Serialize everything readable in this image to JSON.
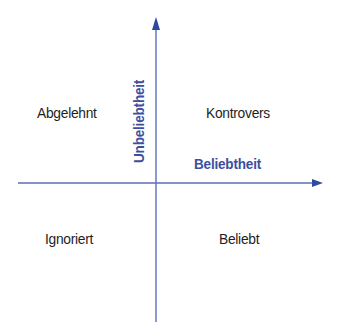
{
  "diagram": {
    "type": "quadrant",
    "colors": {
      "axis": "#4a64b0",
      "axis_label": "#3c4f9e",
      "quadrant_text": "#1e1e1e"
    },
    "axes": {
      "x_label": "Beliebtheit",
      "y_label": "Unbeliebtheit"
    },
    "quadrants": {
      "top_left": "Abgelehnt",
      "top_right": "Kontrovers",
      "bottom_left": "Ignoriert",
      "bottom_right": "Beliebt"
    }
  }
}
